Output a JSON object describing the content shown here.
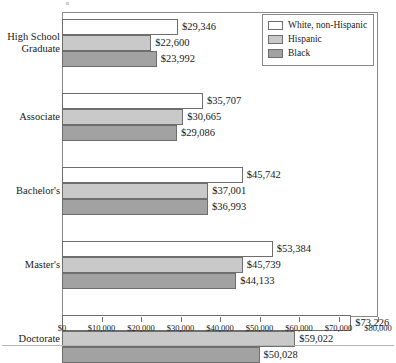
{
  "chart_data": {
    "type": "bar",
    "orientation": "horizontal",
    "title": "",
    "xlabel": "",
    "ylabel": "",
    "xlim": [
      0,
      80000
    ],
    "xticks": [
      0,
      10000,
      20000,
      30000,
      40000,
      50000,
      60000,
      70000,
      80000
    ],
    "xtick_labels": [
      "$0",
      "$10,000",
      "$20,000",
      "$30,000",
      "$40,000",
      "$50,000",
      "$60,000",
      "$70,000",
      "$80,000"
    ],
    "grid": false,
    "legend_position": "top-right",
    "categories": [
      "High School\nGraduate",
      "Associate",
      "Bachelor's",
      "Master's",
      "Doctorate"
    ],
    "series": [
      {
        "name": "White, non-Hispanic",
        "color": "#ffffff",
        "values": [
          29346,
          35707,
          45742,
          53384,
          73226
        ],
        "labels": [
          "$29,346",
          "$35,707",
          "$45,742",
          "$53,384",
          "$73,226"
        ]
      },
      {
        "name": "Hispanic",
        "color": "#c9c9c9",
        "values": [
          22600,
          30665,
          37001,
          45739,
          59022
        ],
        "labels": [
          "$22,600",
          "$30,665",
          "$37,001",
          "$45,739",
          "$59,022"
        ]
      },
      {
        "name": "Black",
        "color": "#a2a2a2",
        "values": [
          23992,
          29086,
          36993,
          44133,
          50028
        ],
        "labels": [
          "$23,992",
          "$29,086",
          "$36,993",
          "$44,133",
          "$50,028"
        ]
      }
    ]
  },
  "legend": {
    "items": [
      {
        "label": "White, non-Hispanic",
        "swatch": "legend-swatch-white"
      },
      {
        "label": "Hispanic",
        "swatch": "legend-swatch-hispanic"
      },
      {
        "label": "Black",
        "swatch": "legend-swatch-black"
      }
    ]
  }
}
